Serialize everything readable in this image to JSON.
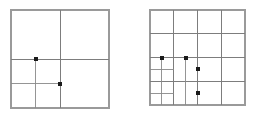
{
  "canvas": {
    "width": 258,
    "height": 117,
    "background": "#ffffff"
  },
  "style": {
    "outline_color": "#9a9a9a",
    "grid_color": "#7d7d7d",
    "fine_grid_color": "#8a8a8a",
    "point_color": "#1a1a1a",
    "outline_width": 1.2,
    "grid_width": 1.0,
    "fine_grid_width": 0.9,
    "point_size": 4
  },
  "chart_data": {
    "type": "diagram",
    "title": "",
    "subtitle": "",
    "xlabel": "",
    "ylabel": "",
    "figures": [
      {
        "id": "left",
        "name": "coarse-refinement-square",
        "label": "",
        "origin_x": 11,
        "origin_y": 10,
        "size": 98,
        "base_divisions": 2,
        "refined_region": {
          "col": 0,
          "row": 1,
          "divisions": 2
        },
        "grid_lines_v": [
          0.5
        ],
        "grid_lines_h": [
          0.5
        ],
        "fine_lines_v": [
          0.25
        ],
        "fine_lines_h": [
          0.75
        ],
        "points": [
          {
            "x": 0.25,
            "y": 0.5,
            "name": "hanging-node-a"
          },
          {
            "x": 0.5,
            "y": 0.75,
            "name": "hanging-node-b"
          }
        ]
      },
      {
        "id": "right",
        "name": "fine-refinement-square",
        "label": "",
        "origin_x": 150,
        "origin_y": 10,
        "size": 95,
        "base_divisions": 4,
        "refined_region": {
          "col": 0,
          "row": 2,
          "divisions": 4
        },
        "grid_lines_v": [
          0.25,
          0.5,
          0.75
        ],
        "grid_lines_h": [
          0.25,
          0.5,
          0.75
        ],
        "fine_lines_v": [
          0.125,
          0.375
        ],
        "fine_lines_h": [
          0.625,
          0.875
        ],
        "points": [
          {
            "x": 0.125,
            "y": 0.5,
            "name": "hanging-node-a"
          },
          {
            "x": 0.375,
            "y": 0.5,
            "name": "hanging-node-b"
          },
          {
            "x": 0.5,
            "y": 0.625,
            "name": "hanging-node-c"
          },
          {
            "x": 0.5,
            "y": 0.875,
            "name": "hanging-node-d"
          }
        ]
      }
    ]
  }
}
